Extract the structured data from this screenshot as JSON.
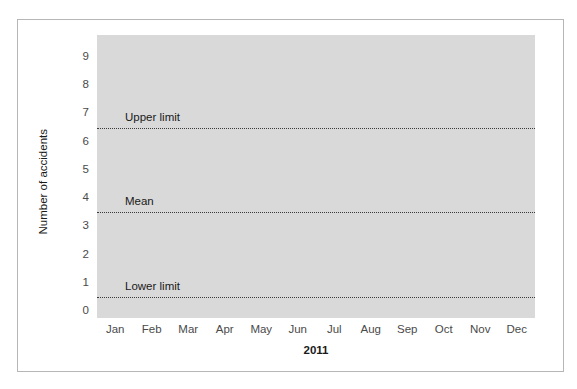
{
  "chart_data": {
    "type": "line",
    "title": "",
    "xlabel": "2011",
    "ylabel": "Number of accidents",
    "categories": [
      "Jan",
      "Feb",
      "Mar",
      "Apr",
      "May",
      "Jun",
      "Jul",
      "Aug",
      "Sep",
      "Oct",
      "Nov",
      "Dec"
    ],
    "yticks": [
      "0",
      "1",
      "2",
      "3",
      "4",
      "5",
      "6",
      "7",
      "8",
      "9"
    ],
    "ylim": [
      -0.2,
      9.5
    ],
    "grid": false,
    "legend": "none",
    "series": [],
    "reference_lines": [
      {
        "name": "upper-limit",
        "label": "Upper limit",
        "value": 6.5,
        "style": "dotted"
      },
      {
        "name": "mean",
        "label": "Mean",
        "value": 3.5,
        "style": "dotted"
      },
      {
        "name": "lower-limit",
        "label": "Lower limit",
        "value": 0.5,
        "style": "dotted"
      }
    ],
    "colors": {
      "panel_background": "#d9d9d9",
      "figure_background": "#ffffff",
      "frame_border": "#b6b6b6",
      "reference_line": "#3a3a3a",
      "tick_text": "#4a4a4a",
      "label_text": "#1a1a1a"
    }
  }
}
